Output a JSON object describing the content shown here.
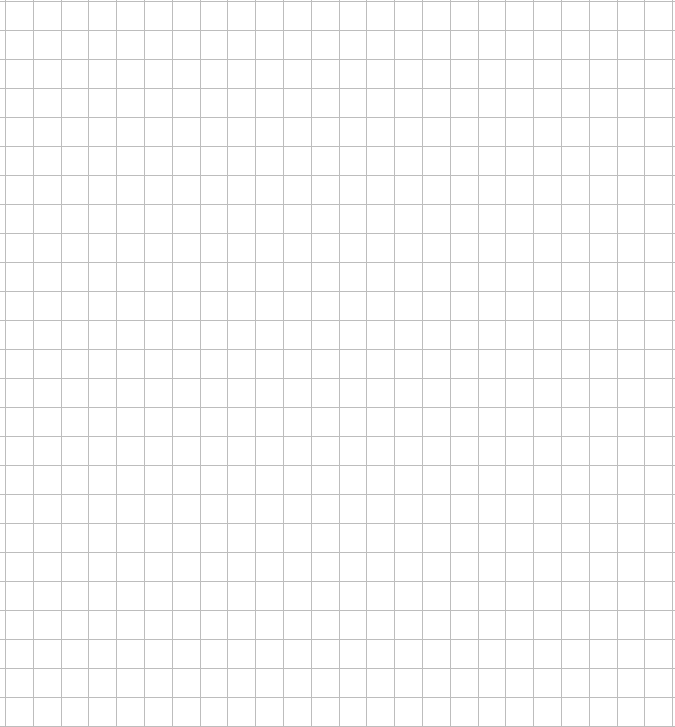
{
  "page": {
    "background_color": "#ffffff",
    "width": 675,
    "height": 727
  },
  "grid": {
    "line_color": "#bdbdbd",
    "line_width": 1,
    "vertical": {
      "start": 5,
      "spacing": 27.8,
      "count": 25
    },
    "horizontal": {
      "start": 0.5,
      "spacing": 29,
      "count": 26
    }
  }
}
